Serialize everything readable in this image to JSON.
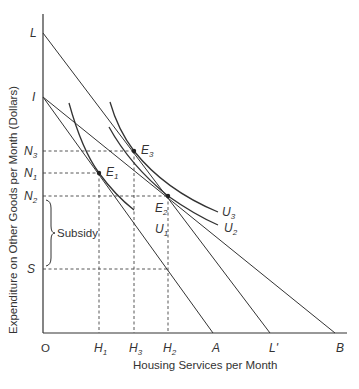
{
  "diagram": {
    "y_axis_title": "Expenditure on Other Goods per Month (Dollars)",
    "x_axis_title": "Housing Services per Month",
    "origin_label": "O",
    "y_labels": {
      "L": "L",
      "I": "I",
      "N3": {
        "base": "N",
        "sub": "3"
      },
      "N1": {
        "base": "N",
        "sub": "1"
      },
      "N2": {
        "base": "N",
        "sub": "2"
      },
      "S": "S"
    },
    "x_labels": {
      "H1": {
        "base": "H",
        "sub": "1"
      },
      "H3": {
        "base": "H",
        "sub": "3"
      },
      "H2": {
        "base": "H",
        "sub": "2"
      },
      "A": "A",
      "Lp": "L'",
      "B": "B"
    },
    "points": {
      "E1": {
        "base": "E",
        "sub": "1"
      },
      "E2": {
        "base": "E",
        "sub": "2"
      },
      "E3": {
        "base": "E",
        "sub": "3"
      }
    },
    "curves": {
      "U1": {
        "base": "U",
        "sub": "1"
      },
      "U2": {
        "base": "U",
        "sub": "2"
      },
      "U3": {
        "base": "U",
        "sub": "3"
      }
    },
    "brace_label": "Subsidy",
    "budget_lines": [
      "L to L'",
      "I to A",
      "I to B"
    ]
  }
}
